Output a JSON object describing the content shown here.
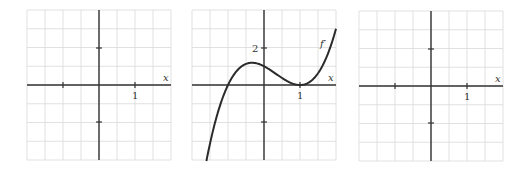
{
  "colors": {
    "grid": "#d9d9d9",
    "axis": "#333333",
    "curve": "#2b2b2b",
    "label": "#333333"
  },
  "panels": [
    {
      "id": "left-blank",
      "x_label": "x",
      "x_tick_label": "1",
      "y_tick_label": "",
      "curve_label": ""
    },
    {
      "id": "middle-fprime",
      "x_label": "x",
      "x_tick_label": "1",
      "y_tick_label": "2",
      "curve_label": "f′"
    },
    {
      "id": "right-blank",
      "x_label": "x",
      "x_tick_label": "1",
      "y_tick_label": "",
      "curve_label": ""
    }
  ],
  "chart_data": [
    {
      "type": "line",
      "title": "",
      "xlabel": "x",
      "ylabel": "",
      "xlim": [
        -2,
        2
      ],
      "ylim": [
        -4,
        4
      ],
      "grid": true,
      "x_ticks": [
        {
          "value": -1,
          "label": ""
        },
        {
          "value": 1,
          "label": "1"
        }
      ],
      "y_ticks": [
        {
          "value": 2,
          "label": ""
        },
        {
          "value": -2,
          "label": ""
        }
      ],
      "series": []
    },
    {
      "type": "line",
      "title": "",
      "xlabel": "x",
      "ylabel": "",
      "xlim": [
        -2,
        2
      ],
      "ylim": [
        -4,
        4
      ],
      "grid": true,
      "x_ticks": [
        {
          "value": 1,
          "label": "1"
        }
      ],
      "y_ticks": [
        {
          "value": 2,
          "label": "2"
        },
        {
          "value": -2,
          "label": ""
        }
      ],
      "annotations": [
        {
          "text": "f′",
          "x": 1.75,
          "y": 2.2
        }
      ],
      "series": [
        {
          "name": "f′",
          "formula": "(x+1)(x-1)^2",
          "x": [
            -1.6,
            -1.4,
            -1.2,
            -1.0,
            -0.8,
            -0.6,
            -0.333,
            0.0,
            0.2,
            0.4,
            0.6,
            0.8,
            1.0,
            1.2,
            1.4,
            1.6,
            1.8,
            2.0
          ],
          "y": [
            -4.06,
            -2.3,
            -0.97,
            0.0,
            0.65,
            1.02,
            1.19,
            1.0,
            0.77,
            0.5,
            0.26,
            0.07,
            0.0,
            0.09,
            0.38,
            0.94,
            1.79,
            3.0
          ]
        }
      ]
    },
    {
      "type": "line",
      "title": "",
      "xlabel": "x",
      "ylabel": "",
      "xlim": [
        -2,
        2
      ],
      "ylim": [
        -4,
        4
      ],
      "grid": true,
      "x_ticks": [
        {
          "value": -1,
          "label": ""
        },
        {
          "value": 1,
          "label": "1"
        }
      ],
      "y_ticks": [
        {
          "value": 2,
          "label": ""
        },
        {
          "value": -2,
          "label": ""
        }
      ],
      "series": []
    }
  ]
}
